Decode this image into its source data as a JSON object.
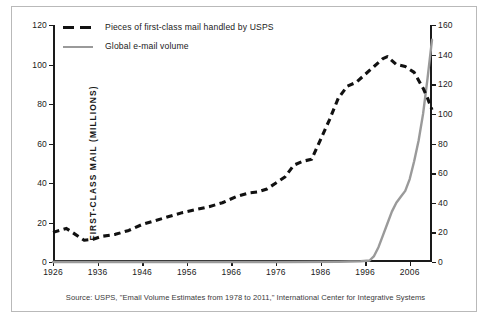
{
  "chart_data": {
    "type": "line",
    "title": "",
    "subtitle": "",
    "xlabel": "",
    "ylabel": "FIRST-CLASS MAIL (MILLIONS)",
    "ylabel_right": "E-MAIL MESSAGES (TRILLIONS)",
    "grid": false,
    "legend_position": "top-left",
    "xlim": [
      1926,
      2011
    ],
    "ylim": [
      0,
      120
    ],
    "ylim_right": [
      0,
      160
    ],
    "xticks": [
      "1926",
      "1936",
      "1946",
      "1956",
      "1966",
      "1976",
      "1986",
      "1996",
      "2006"
    ],
    "xtick_values": [
      1926,
      1936,
      1946,
      1956,
      1966,
      1976,
      1986,
      1996,
      2006
    ],
    "yticks_left": [
      "0",
      "20",
      "40",
      "60",
      "80",
      "100",
      "120"
    ],
    "ytick_left_values": [
      0,
      20,
      40,
      60,
      80,
      100,
      120
    ],
    "yticks_right": [
      "0",
      "20",
      "40",
      "60",
      "80",
      "100",
      "120",
      "140",
      "160"
    ],
    "ytick_right_values": [
      0,
      20,
      40,
      60,
      80,
      100,
      120,
      140,
      160
    ],
    "series": [
      {
        "name": "Pieces of first-class mail handled by USPS",
        "axis": "left",
        "style": "dashed",
        "color": "#111111",
        "unit": "millions",
        "x": [
          1926,
          1929,
          1931,
          1933,
          1935,
          1937,
          1940,
          1943,
          1946,
          1949,
          1952,
          1955,
          1958,
          1961,
          1964,
          1967,
          1970,
          1972,
          1974,
          1976,
          1978,
          1980,
          1982,
          1984,
          1986,
          1988,
          1990,
          1992,
          1994,
          1996,
          1998,
          2000,
          2001,
          2003,
          2005,
          2007,
          2009,
          2010,
          2011
        ],
        "y": [
          15,
          17,
          14,
          11,
          11.5,
          13,
          14,
          16,
          19,
          21,
          23,
          25,
          26.5,
          28,
          30,
          33,
          35,
          35.5,
          37,
          40,
          43,
          49,
          51,
          52,
          62,
          72,
          83,
          89,
          91,
          95,
          99,
          103,
          104,
          100,
          99,
          96,
          88,
          83,
          77
        ]
      },
      {
        "name": "Global e-mail volume",
        "axis": "right",
        "style": "solid",
        "color": "#9a9a9a",
        "unit": "trillions",
        "x": [
          1926,
          1978,
          1990,
          1995,
          1997,
          1998,
          1999,
          2000,
          2001,
          2002,
          2003,
          2004,
          2005,
          2006,
          2007,
          2008,
          2009,
          2010,
          2011
        ],
        "y": [
          0,
          0,
          0.2,
          0.5,
          1,
          4,
          10,
          18,
          26,
          34,
          40,
          44,
          48,
          56,
          68,
          82,
          100,
          124,
          150
        ]
      }
    ],
    "source": "Source: USPS, \"Email Volume Estimates from 1978 to 2011,\" International Center for Integrative Systems"
  },
  "legend": {
    "items": [
      {
        "label": "Pieces of first-class mail handled by USPS",
        "style": "dashed",
        "color": "#111111"
      },
      {
        "label": "Global e-mail volume",
        "style": "solid",
        "color": "#9a9a9a"
      }
    ]
  },
  "axes": {
    "left_title": "FIRST-CLASS MAIL (MILLIONS)",
    "right_title": "E-MAIL MESSAGES (TRILLIONS)"
  },
  "source_note": "Source: USPS, \"Email Volume Estimates from 1978 to 2011,\" International Center for Integrative Systems",
  "colors": {
    "mail_series": "#111111",
    "email_series": "#9a9a9a",
    "axis": "#1a1a1a",
    "frame": "#b9b9b9",
    "background": "#ffffff"
  }
}
